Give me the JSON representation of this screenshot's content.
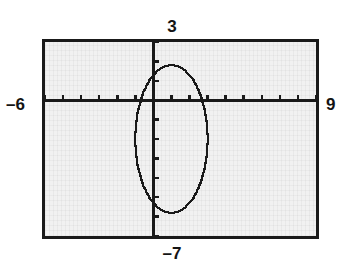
{
  "screen": {
    "width": 344,
    "height": 276,
    "background_color": "#ffffff",
    "screen_fill_color": "#f1f1f1",
    "ink_color": "#1a1a1a",
    "border_color": "#1a1a1a"
  },
  "window_labels": {
    "ymax_label": "3",
    "ymin_label": "–7",
    "xmin_label": "–6",
    "xmax_label": "9"
  },
  "chart_data": {
    "type": "line",
    "title": "",
    "subtitle": "",
    "xlabel": "",
    "ylabel": "",
    "grid": false,
    "legend": "none",
    "axes": {
      "x_axis_shown": true,
      "y_axis_shown": true,
      "tick_marks": true,
      "x_tick_step": 1,
      "y_tick_step": 1,
      "x_ticks": [
        -6,
        -5,
        -4,
        -3,
        -2,
        -1,
        0,
        1,
        2,
        3,
        4,
        5,
        6,
        7,
        8,
        9
      ],
      "y_ticks": [
        -7,
        -6,
        -5,
        -4,
        -3,
        -2,
        -1,
        0,
        1,
        2,
        3
      ]
    },
    "xlim": [
      -6,
      9
    ],
    "ylim": [
      -7,
      3
    ],
    "annotations": [
      {
        "name": "xmin",
        "value": -6,
        "text": "–6",
        "position": "left-outside"
      },
      {
        "name": "xmax",
        "value": 9,
        "text": "9",
        "position": "right-outside"
      },
      {
        "name": "ymax",
        "value": 3,
        "text": "3",
        "position": "top-outside"
      },
      {
        "name": "ymin",
        "value": -7,
        "text": "–7",
        "position": "bottom-outside"
      }
    ],
    "series": [
      {
        "name": "ellipse",
        "shape": "ellipse",
        "center_x": 1,
        "center_y": -2,
        "semi_axis_x": 2,
        "semi_axis_y": 3.8,
        "style": "pixelated-curve",
        "color": "#1a1a1a"
      }
    ]
  }
}
